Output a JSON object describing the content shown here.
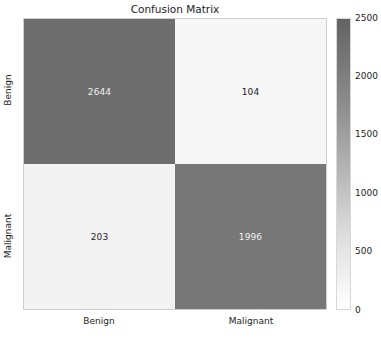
{
  "chart_data": {
    "type": "heatmap",
    "title": "Confusion Matrix",
    "xlabel": "",
    "ylabel": "",
    "categories_x": [
      "Benign",
      "Malignant"
    ],
    "categories_y": [
      "Benign",
      "Malignant"
    ],
    "rows": [
      {
        "label": "Benign",
        "values": [
          2644,
          104
        ]
      },
      {
        "label": "Malignant",
        "values": [
          203,
          1996
        ]
      }
    ],
    "cells": [
      {
        "row": "Benign",
        "col": "Benign",
        "value": 2644,
        "display": "2644",
        "fill": "#6e6e6e",
        "text_color": "#f0f0f0"
      },
      {
        "row": "Benign",
        "col": "Malignant",
        "value": 104,
        "display": "104",
        "fill": "#f6f6f6",
        "text_color": "#1c1c1c"
      },
      {
        "row": "Malignant",
        "col": "Benign",
        "value": 203,
        "display": "203",
        "fill": "#f3f3f3",
        "text_color": "#1c1c1c"
      },
      {
        "row": "Malignant",
        "col": "Malignant",
        "value": 1996,
        "display": "1996",
        "fill": "#777777",
        "text_color": "#f0f0f0"
      }
    ],
    "colorbar": {
      "ticks": [
        2500,
        2000,
        1500,
        1000,
        500,
        0
      ],
      "tick_labels": [
        "2500",
        "2000",
        "1500",
        "1000",
        "500",
        "0"
      ],
      "vmin": 0,
      "vmax": 2500,
      "colormap": "Greys",
      "position": "right",
      "top_color": "#636363",
      "bottom_color": "#ffffff"
    },
    "grid": false,
    "annotations_shown": true
  },
  "figure": {
    "background": "#ffffff",
    "axis_text_color": "#1c1c1c"
  }
}
